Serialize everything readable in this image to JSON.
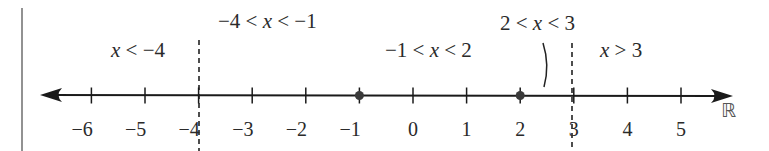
{
  "diagram": {
    "axis": {
      "min_label": -6,
      "max_label": 5,
      "ticks": [
        -6,
        -5,
        -4,
        -3,
        -2,
        -1,
        0,
        1,
        2,
        3,
        4,
        5
      ],
      "tick_labels": [
        "−6",
        "−5",
        "−4",
        "−3",
        "−2",
        "−1",
        "0",
        "1",
        "2",
        "3",
        "4",
        "5"
      ],
      "set_symbol": "ℝ",
      "color": "#1a1a1a"
    },
    "critical_points_dashed": [
      -4,
      3
    ],
    "solid_dots": [
      -1,
      2
    ],
    "regions": [
      {
        "id": "r1",
        "text_parts": [
          "x",
          " < −4"
        ],
        "label": "x < −4"
      },
      {
        "id": "r2",
        "text_parts": [
          "−4 < ",
          "x",
          " < −1"
        ],
        "label": "−4 < x < −1"
      },
      {
        "id": "r3",
        "text_parts": [
          "−1 < ",
          "x",
          " < 2"
        ],
        "label": "−1 < x < 2"
      },
      {
        "id": "r4",
        "text_parts": [
          "2 < ",
          "x",
          " < 3"
        ],
        "label": "2 < x < 3"
      },
      {
        "id": "r5",
        "text_parts": [
          "x",
          " > 3"
        ],
        "label": "x > 3"
      }
    ],
    "colors": {
      "line": "#1a1a1a",
      "dot": "#3a3a3a",
      "frame": "#777777",
      "text": "#2a2a2a"
    }
  }
}
